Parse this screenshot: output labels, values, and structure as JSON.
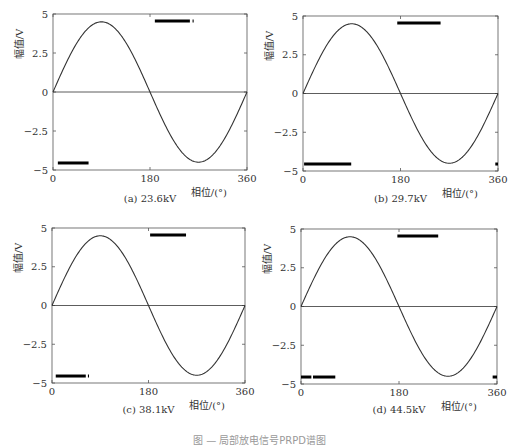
{
  "figure_caption": "图 — 局部放电信号PRPD谱图",
  "chart_data": [
    {
      "type": "line",
      "panel": "a",
      "caption": "(a) 23.6kV",
      "xlabel": "相位/(°)",
      "ylabel": "幅值/V",
      "xlim": [
        0,
        360
      ],
      "ylim": [
        -5,
        5
      ],
      "xticks": [
        "0",
        "180",
        "360"
      ],
      "yticks": [
        "5",
        "2.5",
        "0",
        "-2.5",
        "-5"
      ],
      "series": [
        {
          "name": "reference sine",
          "kind": "sine",
          "amplitude": 4.5,
          "period_deg": 360
        },
        {
          "name": "zero line",
          "kind": "hline",
          "y": 0
        }
      ],
      "pd_clusters": [
        {
          "x_start": 9,
          "x_end": 66,
          "y": -4.55
        },
        {
          "x_start": 189,
          "x_end": 254,
          "y": 4.55
        },
        {
          "x_start": 259,
          "x_end": 261,
          "y": 4.55
        }
      ]
    },
    {
      "type": "line",
      "panel": "b",
      "caption": "(b) 29.7kV",
      "xlabel": "相位/(°)",
      "ylabel": "幅值/V",
      "xlim": [
        0,
        360
      ],
      "ylim": [
        -5,
        5
      ],
      "xticks": [
        "0",
        "180",
        "360"
      ],
      "yticks": [
        "5",
        "2.5",
        "0",
        "-2.5",
        "-5"
      ],
      "series": [
        {
          "name": "reference sine",
          "kind": "sine",
          "amplitude": 4.5,
          "period_deg": 360
        },
        {
          "name": "zero line",
          "kind": "hline",
          "y": 0
        }
      ],
      "pd_clusters": [
        {
          "x_start": 2,
          "x_end": 89,
          "y": -4.55
        },
        {
          "x_start": 174,
          "x_end": 254,
          "y": 4.55
        },
        {
          "x_start": 355,
          "x_end": 360,
          "y": -4.55
        }
      ]
    },
    {
      "type": "line",
      "panel": "c",
      "caption": "(c) 38.1kV",
      "xlabel": "相位/(°)",
      "ylabel": "幅值/V",
      "xlim": [
        0,
        360
      ],
      "ylim": [
        -5,
        5
      ],
      "xticks": [
        "0",
        "180",
        "360"
      ],
      "yticks": [
        "5",
        "2.5",
        "0",
        "-2.5",
        "-5"
      ],
      "series": [
        {
          "name": "reference sine",
          "kind": "sine",
          "amplitude": 4.5,
          "period_deg": 360
        },
        {
          "name": "zero line",
          "kind": "hline",
          "y": 0
        }
      ],
      "pd_clusters": [
        {
          "x_start": 7,
          "x_end": 63,
          "y": -4.55
        },
        {
          "x_start": 67,
          "x_end": 69,
          "y": -4.55
        },
        {
          "x_start": 183,
          "x_end": 250,
          "y": 4.55
        }
      ]
    },
    {
      "type": "line",
      "panel": "d",
      "caption": "(d) 44.5kV",
      "xlabel": "相位/(°)",
      "ylabel": "幅值/V",
      "xlim": [
        0,
        360
      ],
      "ylim": [
        -5,
        5
      ],
      "xticks": [
        "0",
        "180",
        "360"
      ],
      "yticks": [
        "5",
        "2.5",
        "0",
        "-2.5",
        "-5"
      ],
      "series": [
        {
          "name": "reference sine",
          "kind": "sine",
          "amplitude": 4.5,
          "period_deg": 360
        },
        {
          "name": "zero line",
          "kind": "hline",
          "y": 0
        }
      ],
      "pd_clusters": [
        {
          "x_start": 0,
          "x_end": 19,
          "y": -4.55
        },
        {
          "x_start": 22,
          "x_end": 63,
          "y": -4.55
        },
        {
          "x_start": 177,
          "x_end": 252,
          "y": 4.55
        },
        {
          "x_start": 352,
          "x_end": 360,
          "y": -4.55
        }
      ]
    }
  ],
  "layout": {
    "panels": [
      {
        "left": 53,
        "top": 14,
        "right": 247,
        "bottom": 170,
        "caption_top": 193
      },
      {
        "left": 303,
        "top": 16,
        "right": 498,
        "bottom": 171,
        "caption_top": 193
      },
      {
        "left": 52,
        "top": 228,
        "right": 245,
        "bottom": 383,
        "caption_top": 404
      },
      {
        "left": 301,
        "top": 229,
        "right": 497,
        "bottom": 384,
        "caption_top": 404
      }
    ],
    "line_color": "#333333",
    "axis_color": "#555555",
    "marker_color": "#000000"
  }
}
